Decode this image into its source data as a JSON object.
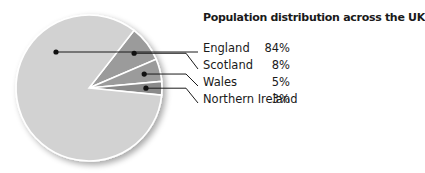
{
  "chart_data": {
    "type": "pie",
    "title": "Population distribution across the UK",
    "categories": [
      "England",
      "Scotland",
      "Wales",
      "Northern Ireland"
    ],
    "values": [
      84,
      8,
      5,
      3
    ],
    "value_labels": [
      "84%",
      "8%",
      "5%",
      "3%"
    ],
    "colors": [
      "#d2d2d2",
      "#9b9b9b",
      "#9b9b9b",
      "#8a8a8a"
    ],
    "legend_position": "right",
    "unit": "%"
  }
}
